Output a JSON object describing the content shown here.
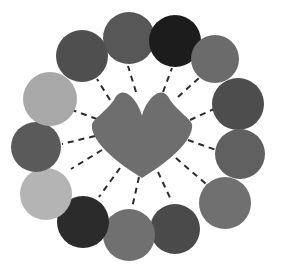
{
  "figure": {
    "background_color": "#ffffff",
    "width": 293,
    "height": 280
  },
  "hub": {
    "name": "center-hub",
    "shape": "heart",
    "fill": "#6e6e6e",
    "center_x": 142,
    "center_y": 131,
    "left": 92,
    "right": 192,
    "top": 85,
    "bottom": 178
  },
  "edges": {
    "style": "dashed",
    "color": "#2b2b2b",
    "width": 2,
    "dash_pattern": "6 5",
    "origin_x": 142,
    "origin_y": 131,
    "count": 12
  },
  "nodes": [
    {
      "id": "node-1",
      "label": "Node 1",
      "angle_deg": 270,
      "cx": 129,
      "cy": 38,
      "r": 26,
      "fill": "#575757"
    },
    {
      "id": "node-2",
      "label": "Node 2",
      "angle_deg": 300,
      "cx": 175,
      "cy": 41,
      "r": 26,
      "fill": "#1c1c1c"
    },
    {
      "id": "node-3",
      "label": "Node 3",
      "angle_deg": 330,
      "cx": 215,
      "cy": 59,
      "r": 24,
      "fill": "#6b6b6b"
    },
    {
      "id": "node-4",
      "label": "Node 4",
      "angle_deg": 0,
      "cx": 238,
      "cy": 104,
      "r": 26,
      "fill": "#4d4d4d"
    },
    {
      "id": "node-5",
      "label": "Node 5",
      "angle_deg": 30,
      "cx": 240,
      "cy": 154,
      "r": 25,
      "fill": "#606060"
    },
    {
      "id": "node-6",
      "label": "Node 6",
      "angle_deg": 60,
      "cx": 225,
      "cy": 203,
      "r": 26,
      "fill": "#707070"
    },
    {
      "id": "node-7",
      "label": "Node 7",
      "angle_deg": 90,
      "cx": 175,
      "cy": 229,
      "r": 25,
      "fill": "#4a4a4a"
    },
    {
      "id": "node-8",
      "label": "Node 8",
      "angle_deg": 120,
      "cx": 129,
      "cy": 235,
      "r": 26,
      "fill": "#707070"
    },
    {
      "id": "node-9",
      "label": "Node 9",
      "angle_deg": 150,
      "cx": 83,
      "cy": 222,
      "r": 26,
      "fill": "#2b2b2b"
    },
    {
      "id": "node-10",
      "label": "Node 10",
      "angle_deg": 180,
      "cx": 46,
      "cy": 194,
      "r": 26,
      "fill": "#b4b4b4"
    },
    {
      "id": "node-11",
      "label": "Node 11",
      "angle_deg": 210,
      "cx": 36,
      "cy": 147,
      "r": 25,
      "fill": "#5a5a5a"
    },
    {
      "id": "node-12",
      "label": "Node 12",
      "angle_deg": 240,
      "cx": 50,
      "cy": 99,
      "r": 27,
      "fill": "#a8a8a8"
    },
    {
      "id": "node-13",
      "label": "Node 13",
      "angle_deg": 255,
      "cx": 82,
      "cy": 56,
      "r": 26,
      "fill": "#4f4f4f"
    }
  ],
  "spokes": [
    {
      "id": "spoke-1",
      "to": "node-1",
      "x1": 136,
      "y1": 92,
      "x2": 128,
      "y2": 66
    },
    {
      "id": "spoke-2",
      "to": "node-2",
      "x1": 163,
      "y1": 92,
      "x2": 172,
      "y2": 68
    },
    {
      "id": "spoke-3",
      "to": "node-3",
      "x1": 178,
      "y1": 97,
      "x2": 200,
      "y2": 77
    },
    {
      "id": "spoke-4",
      "to": "node-4",
      "x1": 190,
      "y1": 120,
      "x2": 214,
      "y2": 109
    },
    {
      "id": "spoke-5",
      "to": "node-5",
      "x1": 188,
      "y1": 140,
      "x2": 216,
      "y2": 150
    },
    {
      "id": "spoke-6",
      "to": "node-6",
      "x1": 176,
      "y1": 158,
      "x2": 206,
      "y2": 184
    },
    {
      "id": "spoke-7",
      "to": "node-7",
      "x1": 158,
      "y1": 172,
      "x2": 172,
      "y2": 202
    },
    {
      "id": "spoke-8",
      "to": "node-8",
      "x1": 139,
      "y1": 177,
      "x2": 132,
      "y2": 208
    },
    {
      "id": "spoke-9",
      "to": "node-9",
      "x1": 120,
      "y1": 168,
      "x2": 99,
      "y2": 197
    },
    {
      "id": "spoke-10",
      "to": "node-10",
      "x1": 102,
      "y1": 150,
      "x2": 71,
      "y2": 169
    },
    {
      "id": "spoke-11",
      "to": "node-11",
      "x1": 95,
      "y1": 136,
      "x2": 62,
      "y2": 144
    },
    {
      "id": "spoke-12",
      "to": "node-12",
      "x1": 97,
      "y1": 119,
      "x2": 72,
      "y2": 110
    },
    {
      "id": "spoke-13",
      "to": "node-13",
      "x1": 110,
      "y1": 100,
      "x2": 97,
      "y2": 79
    }
  ]
}
